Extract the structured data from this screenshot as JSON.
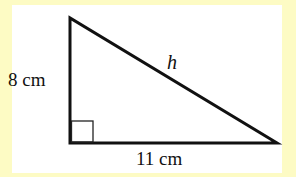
{
  "figure": {
    "type": "right-triangle",
    "vertices": {
      "top": [
        70,
        18
      ],
      "right_angle": [
        70,
        143
      ],
      "right": [
        277,
        143
      ]
    },
    "right_angle_marker": true,
    "labels": {
      "vertical_leg": "8 cm",
      "horizontal_leg": "11 cm",
      "hypotenuse": "h"
    }
  },
  "colors": {
    "border": "#fdfbc4",
    "panel": "#ffffff",
    "stroke": "#111111"
  }
}
